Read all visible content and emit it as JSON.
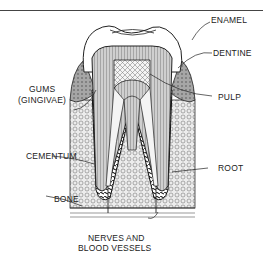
{
  "diagram": {
    "labels": {
      "enamel": "ENAMEL",
      "dentine": "DENTINE",
      "gums_line1": "GUMS",
      "gums_line2": "(GINGIVAE)",
      "pulp": "PULP",
      "cementum": "CEMENTUM",
      "root": "ROOT",
      "bone": "BONE",
      "nerves_line1": "NERVES AND",
      "nerves_line2": "BLOOD VESSELS"
    },
    "colors": {
      "ink": "#222222",
      "paper": "#ffffff",
      "dentine_fill": "#bdbdbd",
      "bone_fill": "#e6e6e6",
      "gum_fill": "#9a9a9a"
    }
  }
}
